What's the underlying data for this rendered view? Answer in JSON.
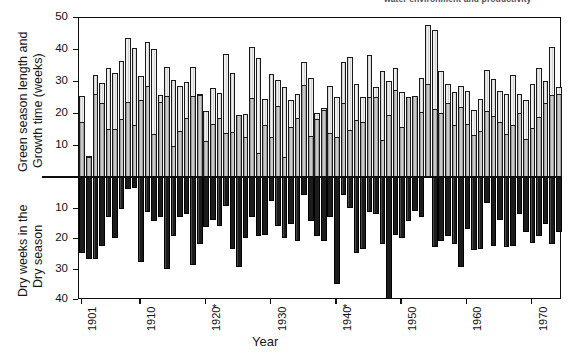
{
  "caption": {
    "top_partial_text": "water environment and productivity"
  },
  "axes": {
    "x_title": "Year",
    "y_title_top_line1": "Green season length and",
    "y_title_top_line2": "Growth time (weeks)",
    "y_title_bottom_line1": "Dry weeks in the",
    "y_title_bottom_line2": "Dry season",
    "y_ticks_top": [
      "50",
      "40",
      "30",
      "20",
      "10"
    ],
    "y_ticks_bottom": [
      "10",
      "20",
      "30",
      "40"
    ],
    "x_ticks": [
      "1901",
      "1910",
      "1920",
      "1930",
      "1940",
      "1950",
      "1960",
      "1970"
    ],
    "x_tick_markers": [
      "",
      "",
      "*",
      "",
      "*",
      "",
      "",
      ""
    ]
  },
  "chart_data": {
    "type": "bar",
    "xlabel": "Year",
    "ylabel_upper": "Green season length and Growth time (weeks)",
    "ylabel_lower": "Dry weeks in the Dry season",
    "ylim_upper": [
      0,
      50
    ],
    "ylim_lower": [
      0,
      40
    ],
    "grid": false,
    "legend_position": "none",
    "x": [
      1901,
      1902,
      1903,
      1904,
      1905,
      1906,
      1907,
      1908,
      1909,
      1910,
      1911,
      1912,
      1913,
      1914,
      1915,
      1916,
      1917,
      1918,
      1919,
      1920,
      1921,
      1922,
      1923,
      1924,
      1925,
      1926,
      1927,
      1928,
      1929,
      1930,
      1931,
      1932,
      1933,
      1934,
      1935,
      1936,
      1937,
      1938,
      1939,
      1940,
      1941,
      1942,
      1943,
      1944,
      1945,
      1946,
      1947,
      1948,
      1949,
      1950,
      1951,
      1952,
      1953,
      1954,
      1955,
      1956,
      1957,
      1958,
      1959,
      1960,
      1961,
      1962,
      1963,
      1964,
      1965,
      1966,
      1967,
      1968,
      1969,
      1970,
      1971,
      1972,
      1973,
      1974
    ],
    "series": [
      {
        "name": "Growth time (weeks)",
        "values": [
          17.2,
          6.2,
          26.0,
          23.2,
          15.0,
          15.1,
          18.0,
          23.3,
          16.1,
          24.2,
          28.3,
          13.4,
          23.3,
          25.2,
          9.8,
          14.3,
          18.4,
          25.3,
          25.5,
          11.4,
          16.6,
          18.4,
          13.7,
          14.2,
          19.4,
          12.5,
          24.6,
          7.6,
          16.4,
          12.6,
          22.1,
          6.4,
          15.5,
          18.3,
          28.8,
          12.8,
          18.1,
          21.0,
          13.8,
          12.4,
          23.0,
          14.6,
          17.9,
          17.3,
          25.1,
          25.0,
          11.6,
          19.5,
          27.2,
          15.7,
          25.0,
          25.3,
          20.2,
          29.0,
          21.4,
          20.0,
          23.0,
          16.3,
          22.0,
          16.7,
          13.2,
          14.5,
          20.7,
          19.2,
          17.2,
          13.5,
          16.4,
          20.0,
          12.0,
          15.3,
          18.7,
          23.0,
          25.7,
          26.0
        ]
      },
      {
        "name": "Green season length (weeks)",
        "values": [
          25.2,
          6.5,
          32.0,
          29.4,
          34.2,
          32.4,
          36.1,
          43.4,
          40.3,
          31.6,
          42.3,
          40.0,
          25.5,
          34.4,
          30.3,
          28.5,
          29.6,
          34.4,
          25.8,
          20.6,
          27.8,
          26.4,
          38.3,
          32.5,
          19.5,
          19.6,
          40.5,
          37.2,
          24.5,
          32.2,
          30.2,
          28.0,
          24.2,
          26.0,
          36.0,
          31.0,
          20.0,
          21.5,
          28.5,
          25.0,
          36.0,
          37.5,
          29.0,
          25.0,
          38.0,
          28.0,
          33.0,
          30.0,
          34.0,
          26.5,
          24.0,
          18.0,
          31.0,
          47.5,
          46.0,
          33.0,
          29.0,
          26.5,
          28.5,
          27.0,
          21.0,
          24.5,
          33.5,
          30.5,
          27.0,
          26.0,
          32.0,
          26.0,
          24.0,
          29.0,
          34.0,
          30.0,
          40.5,
          28.0
        ]
      },
      {
        "name": "Dry weeks in the Dry season",
        "values": [
          25.0,
          27.0,
          27.0,
          22.5,
          13.0,
          20.0,
          10.5,
          4.0,
          3.5,
          28.0,
          11.5,
          14.5,
          13.0,
          30.0,
          19.5,
          13.0,
          12.0,
          29.0,
          22.0,
          16.5,
          14.0,
          16.0,
          9.5,
          23.5,
          29.5,
          20.0,
          13.0,
          19.5,
          19.0,
          8.0,
          16.0,
          20.0,
          15.5,
          21.0,
          6.0,
          14.5,
          19.5,
          21.0,
          13.0,
          35.0,
          6.0,
          10.0,
          25.0,
          23.5,
          11.5,
          12.0,
          22.0,
          40.0,
          19.0,
          20.0,
          14.5,
          11.0,
          13.0,
          0.0,
          23.0,
          21.0,
          19.5,
          22.0,
          29.5,
          17.0,
          24.0,
          23.5,
          8.5,
          22.5,
          14.0,
          23.0,
          22.5,
          12.0,
          18.0,
          21.5,
          19.5,
          15.5,
          22.0,
          18.0
        ]
      }
    ]
  }
}
